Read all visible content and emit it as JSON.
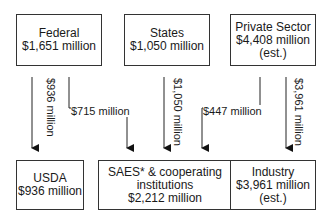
{
  "sources": [
    {
      "name": "Federal",
      "amount": "$1,651 million",
      "note": ""
    },
    {
      "name": "States",
      "amount": "$1,050 million",
      "note": ""
    },
    {
      "name": "Private Sector",
      "amount": "$4,408 million",
      "note": "(est.)"
    }
  ],
  "recipients": [
    {
      "name": "USDA",
      "amount": "$936 million",
      "note": ""
    },
    {
      "name": "SAES* & cooperating",
      "name2": "institutions",
      "amount": "$2,212 million"
    },
    {
      "name": "Industry",
      "amount": "$3,961 million",
      "note": "(est.)"
    }
  ],
  "flows": {
    "federal_to_usda": "$936 million",
    "federal_to_saes": "$715 million",
    "states_to_saes": "$1,050 million",
    "private_to_saes": "$447 million",
    "private_to_industry": "$3,961 million"
  }
}
